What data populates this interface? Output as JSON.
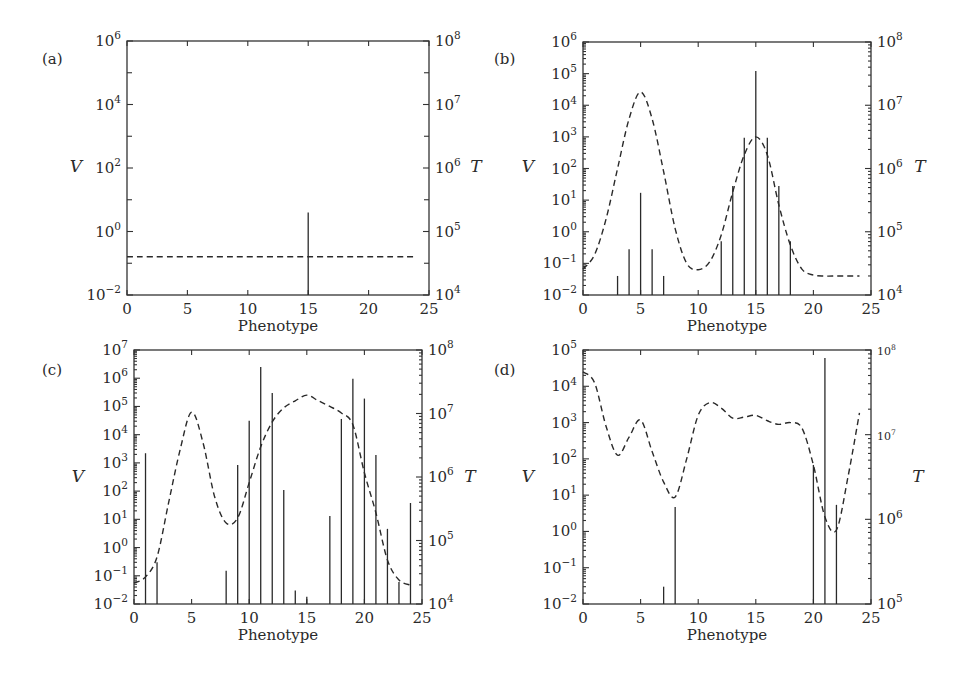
{
  "figure": {
    "panels": [
      {
        "id": "a",
        "label": "(a)"
      },
      {
        "id": "b",
        "label": "(b)"
      },
      {
        "id": "c",
        "label": "(c)"
      },
      {
        "id": "d",
        "label": "(d)"
      }
    ]
  },
  "chart_data": [
    {
      "panel": "(a)",
      "type": "bar+line",
      "xlabel": "Phenotype",
      "ylabel_left": "V",
      "ylabel_right": "T",
      "xlim": [
        0,
        25
      ],
      "xticks": [
        0,
        5,
        10,
        15,
        20,
        25
      ],
      "ylim_left_log10": [
        -2,
        6
      ],
      "yticks_left": [
        "10^-2",
        "10^0",
        "10^2",
        "10^4",
        "10^6"
      ],
      "ylim_right_log10": [
        4,
        8
      ],
      "yticks_right": [
        "10^4",
        "10^5",
        "10^6",
        "10^7",
        "10^8"
      ],
      "ylabel_inline": true,
      "bars_V": {
        "x": [
          15
        ],
        "values": [
          4
        ]
      },
      "curve_T": {
        "style": "dashed",
        "x": [
          0,
          24
        ],
        "values_on_V_scale": [
          0.16,
          0.16
        ],
        "values": [
          35000.0,
          35000.0
        ]
      }
    },
    {
      "panel": "(b)",
      "type": "bar+line",
      "xlabel": "Phenotype",
      "ylabel_left": "V",
      "ylabel_right": "T",
      "xlim": [
        0,
        25
      ],
      "xticks": [
        0,
        5,
        10,
        15,
        20,
        25
      ],
      "ylim_left_log10": [
        -2,
        6
      ],
      "yticks_left": [
        "10^-2",
        "10^-1",
        "10^0",
        "10^1",
        "10^2",
        "10^3",
        "10^4",
        "10^5",
        "10^6"
      ],
      "ylim_right_log10": [
        4,
        8
      ],
      "yticks_right": [
        "10^4",
        "10^5",
        "10^6",
        "10^7",
        "10^8"
      ],
      "bars_V": {
        "x": [
          3,
          4,
          5,
          6,
          7,
          12,
          13,
          14,
          15,
          16,
          17,
          18
        ],
        "values": [
          0.04,
          0.28,
          17,
          0.28,
          0.04,
          0.5,
          28,
          930,
          120000,
          930,
          28,
          0.5
        ]
      },
      "curve_T": {
        "style": "dashed",
        "x": [
          0,
          1,
          2,
          3,
          4,
          5,
          6,
          7,
          8,
          9,
          10,
          11,
          12,
          13,
          14,
          15,
          16,
          17,
          18,
          19,
          20,
          21,
          22,
          23,
          24
        ],
        "log10_on_V_scale": [
          -1.18,
          -0.73,
          0.4,
          2.0,
          3.57,
          4.42,
          3.57,
          1.9,
          0.1,
          -1.0,
          -1.2,
          -0.95,
          -0.1,
          1.26,
          2.43,
          3.0,
          2.43,
          0.85,
          -0.42,
          -1.18,
          -1.37,
          -1.4,
          -1.4,
          -1.4,
          -1.4
        ]
      }
    },
    {
      "panel": "(c)",
      "type": "bar+line",
      "xlabel": "Phenotype",
      "ylabel_left": "V",
      "ylabel_right": "T",
      "xlim": [
        0,
        25
      ],
      "xticks": [
        0,
        5,
        10,
        15,
        20,
        25
      ],
      "ylim_left_log10": [
        -2,
        7
      ],
      "yticks_left": [
        "10^-2",
        "10^-1",
        "10^0",
        "10^1",
        "10^2",
        "10^3",
        "10^4",
        "10^5",
        "10^6",
        "10^7"
      ],
      "ylim_right_log10": [
        4,
        8
      ],
      "yticks_right": [
        "10^4",
        "10^5",
        "10^6",
        "10^7",
        "10^8"
      ],
      "bars_V": {
        "x": [
          1,
          2,
          8,
          9,
          10,
          11,
          12,
          13,
          14,
          15,
          17,
          18,
          19,
          20,
          21,
          22,
          23,
          24
        ],
        "values": [
          2200,
          0.3,
          0.15,
          850,
          31000,
          2500000,
          300000,
          110,
          0.03,
          0.018,
          13,
          36000,
          950000,
          190000,
          1900,
          4.6,
          0.06,
          38
        ]
      },
      "curve_T": {
        "style": "dashed",
        "x": [
          0,
          1,
          2,
          3,
          4,
          5,
          6,
          7,
          8,
          9,
          10,
          11,
          12,
          13,
          14,
          15,
          16,
          17,
          18,
          19,
          20,
          21,
          22,
          23,
          24
        ],
        "log10_on_V_scale": [
          -1.26,
          -1.04,
          -0.33,
          1.58,
          3.46,
          4.8,
          3.7,
          1.8,
          0.87,
          1.05,
          2.3,
          3.57,
          4.45,
          4.95,
          5.2,
          5.4,
          5.2,
          5.0,
          4.77,
          4.35,
          2.65,
          1.23,
          -0.44,
          -1.15,
          -1.33
        ]
      }
    },
    {
      "panel": "(d)",
      "type": "bar+line",
      "xlabel": "Phenotype",
      "ylabel_left": "V",
      "ylabel_right": "T",
      "xlim": [
        0,
        25
      ],
      "xticks": [
        0,
        5,
        10,
        15,
        20,
        25
      ],
      "ylim_left_log10": [
        -2,
        5
      ],
      "yticks_left": [
        "10^-2",
        "10^-1",
        "10^0",
        "10^1",
        "10^2",
        "10^3",
        "10^4",
        "10^5"
      ],
      "ylim_right_log10": [
        5,
        8
      ],
      "yticks_right": [
        "10^5",
        "10^6",
        "10^7",
        "10^8"
      ],
      "bars_V": {
        "x": [
          7,
          8,
          20,
          21,
          22
        ],
        "values": [
          0.03,
          4.7,
          68,
          60000,
          5.4
        ]
      },
      "curve_T": {
        "style": "dashed",
        "x": [
          0,
          1,
          2,
          3,
          4,
          5,
          6,
          7,
          8,
          9,
          10,
          11,
          12,
          13,
          14,
          15,
          16,
          17,
          18,
          19,
          20,
          21,
          22,
          23,
          24
        ],
        "log10_on_V_scale": [
          4.4,
          4.1,
          2.9,
          2.1,
          2.6,
          3.07,
          2.2,
          1.36,
          0.95,
          2.0,
          3.2,
          3.55,
          3.4,
          3.12,
          3.15,
          3.2,
          3.05,
          2.95,
          3.0,
          2.85,
          1.83,
          0.4,
          0.04,
          1.5,
          3.27
        ]
      }
    }
  ]
}
